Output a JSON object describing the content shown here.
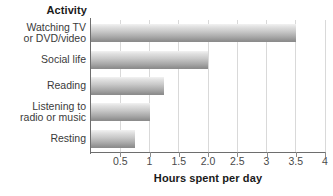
{
  "chart_data": {
    "type": "bar",
    "orientation": "horizontal",
    "title": "Activity",
    "xlabel": "Hours spent per day",
    "ylabel": "Activity",
    "categories": [
      "Watching TV\nor DVD/video",
      "Social life",
      "Reading",
      "Listening to\nradio or music",
      "Resting"
    ],
    "values": [
      3.5,
      2.0,
      1.25,
      1.0,
      0.75
    ],
    "xlim": [
      0,
      4
    ],
    "ylim": null,
    "xticks": [
      0.5,
      1,
      1.5,
      2,
      2.5,
      3,
      3.5,
      4
    ],
    "xtick_labels": [
      "0.5",
      "1",
      "1.5",
      "2.0",
      "2.5",
      "3",
      "3.5",
      "4"
    ],
    "grid": "vertical",
    "legend": null,
    "bar_color_light": "#f2f2f2",
    "bar_color_dark": "#8a8a8a",
    "axis_color": "#6e6e6e",
    "gridline_color": "#d9d9d9",
    "background": "#ffffff"
  },
  "ticks": [
    {
      "label": "0.5",
      "value": 0.5
    },
    {
      "label": "1",
      "value": 1
    },
    {
      "label": "1.5",
      "value": 1.5
    },
    {
      "label": "2.0",
      "value": 2
    },
    {
      "label": "2.5",
      "value": 2.5
    },
    {
      "label": "3",
      "value": 3
    },
    {
      "label": "3.5",
      "value": 3.5
    },
    {
      "label": "4",
      "value": 4
    }
  ],
  "bars": [
    {
      "label": "Watching TV\nor DVD/video",
      "value": 3.5
    },
    {
      "label": "Social life",
      "value": 2.0
    },
    {
      "label": "Reading",
      "value": 1.25
    },
    {
      "label": "Listening to\nradio or music",
      "value": 1.0
    },
    {
      "label": "Resting",
      "value": 0.75
    }
  ]
}
